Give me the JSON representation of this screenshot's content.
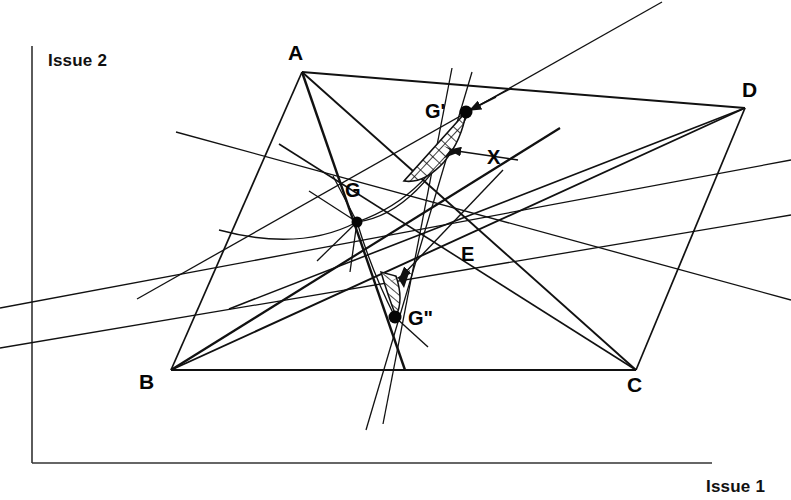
{
  "figure": {
    "title_alt": "Negotiation geometry diagram with quadrilateral ABCD and points G, G', G'', E, X",
    "background_color": "#ffffff",
    "ink_color": "#111111"
  },
  "axes": {
    "y_label": "Issue 2",
    "x_label": "Issue 1",
    "origin": {
      "x": 32,
      "y": 463
    },
    "y_top": {
      "x": 32,
      "y": 46
    },
    "x_right": {
      "x": 712,
      "y": 463
    },
    "y_label_pos": {
      "x": 48,
      "y": 66
    },
    "x_label_pos": {
      "x": 706,
      "y": 492
    }
  },
  "vertices": [
    {
      "id": "A",
      "label": "A",
      "x": 302,
      "y": 72,
      "label_x": 288,
      "label_y": 60
    },
    {
      "id": "B",
      "label": "B",
      "x": 171,
      "y": 370,
      "label_x": 139,
      "label_y": 389
    },
    {
      "id": "C",
      "label": "C",
      "x": 636,
      "y": 370,
      "label_x": 627,
      "label_y": 392
    },
    {
      "id": "D",
      "label": "D",
      "x": 745,
      "y": 108,
      "label_x": 742,
      "label_y": 97
    }
  ],
  "points": [
    {
      "id": "G",
      "label": "G",
      "x": 357,
      "y": 222,
      "label_x": 345,
      "label_y": 197,
      "dot": true,
      "dot_r": 5.5
    },
    {
      "id": "Gp",
      "label": "G'",
      "x": 466,
      "y": 112,
      "label_x": 427,
      "label_y": 116,
      "dot": true,
      "dot_r": 6.5
    },
    {
      "id": "Gpp",
      "label": "G\"",
      "x": 395,
      "y": 317,
      "label_x": 408,
      "label_y": 323,
      "dot": true,
      "dot_r": 6.5
    },
    {
      "id": "E",
      "label": "E",
      "x": 475,
      "y": 224,
      "label_x": 461,
      "label_y": 261,
      "dot": false,
      "dot_r": 0
    },
    {
      "id": "X",
      "label": "X",
      "x": 496,
      "y": 155,
      "label_x": 487,
      "label_y": 163,
      "dot": false,
      "dot_r": 0
    }
  ],
  "quadrilateral": {
    "name": "ABCD",
    "edges": [
      {
        "from": "A",
        "to": "D"
      },
      {
        "from": "A",
        "to": "B"
      },
      {
        "from": "B",
        "to": "C"
      },
      {
        "from": "C",
        "to": "D"
      }
    ]
  },
  "diagonals": [
    {
      "from": "A",
      "to": "C",
      "note": "passes through E"
    },
    {
      "from": "B",
      "to": "D",
      "note": "passes through E"
    }
  ],
  "cevians_from_vertices": [
    {
      "from": "A",
      "through": "G"
    },
    {
      "from": "B",
      "through": "G"
    },
    {
      "from": "C",
      "through": "G"
    },
    {
      "from": "D",
      "through": "G"
    }
  ],
  "hatched_regions": [
    {
      "id": "lens-Gp",
      "near": "G'",
      "style": "cross-hatched",
      "from_x": 466,
      "from_y": 112,
      "to_x": 404,
      "to_y": 180
    },
    {
      "id": "sliver-Gpp",
      "near": "G\"",
      "style": "hatched",
      "from_x": 383,
      "from_y": 275,
      "to_x": 398,
      "to_y": 316
    }
  ],
  "arrows": [
    {
      "id": "x-pointer-upper",
      "from_x": 516,
      "from_y": 162,
      "to_x": 452,
      "to_y": 150,
      "label": "X"
    },
    {
      "id": "x-pointer-lower",
      "from_x": 500,
      "from_y": 168,
      "to_x": 396,
      "to_y": 280,
      "label": "X"
    },
    {
      "id": "gp-pointer",
      "from_x": 492,
      "from_y": 99,
      "to_x": 466,
      "to_y": 112,
      "label": "G'"
    }
  ],
  "line_count": 22
}
